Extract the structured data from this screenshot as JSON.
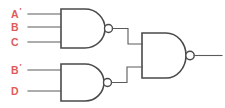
{
  "diagram": {
    "type": "logic-circuit",
    "background_color": "#ffffff",
    "wire_color": "#5a5a5a",
    "gate_outline_color": "#4a4a4a",
    "label_color": "#e05a5a",
    "inputs": [
      {
        "id": "in-a-not",
        "label": "A",
        "prime": "′",
        "full_label": "A′",
        "target_gate": "nand-1",
        "pin_index": 1
      },
      {
        "id": "in-b",
        "label": "B",
        "prime": "",
        "full_label": "B",
        "target_gate": "nand-1",
        "pin_index": 2
      },
      {
        "id": "in-c",
        "label": "C",
        "prime": "",
        "full_label": "C",
        "target_gate": "nand-1",
        "pin_index": 3
      },
      {
        "id": "in-b-not",
        "label": "B",
        "prime": "′",
        "full_label": "B′",
        "target_gate": "nand-2",
        "pin_index": 1
      },
      {
        "id": "in-d",
        "label": "D",
        "prime": "",
        "full_label": "D",
        "target_gate": "nand-2",
        "pin_index": 2
      }
    ],
    "gates": [
      {
        "id": "nand-1",
        "type": "NAND",
        "inputs": 3,
        "input_labels": [
          "A′",
          "B",
          "C"
        ],
        "position": "top-left"
      },
      {
        "id": "nand-2",
        "type": "NAND",
        "inputs": 2,
        "input_labels": [
          "B′",
          "D"
        ],
        "position": "bottom-left"
      },
      {
        "id": "nand-3",
        "type": "NAND",
        "inputs": 2,
        "input_labels": [
          "nand-1",
          "nand-2"
        ],
        "position": "right"
      }
    ],
    "output": {
      "id": "out-1",
      "label": "",
      "source_gate": "nand-3"
    }
  }
}
